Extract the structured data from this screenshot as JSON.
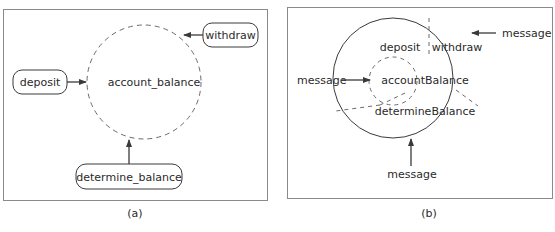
{
  "panel_a": {
    "caption": "(a)",
    "center_label": "account_balance",
    "operations": {
      "deposit": "deposit",
      "withdraw": "withdraw",
      "determine_balance": "determine_balance"
    }
  },
  "panel_b": {
    "caption": "(b)",
    "center_label": "accountBalance",
    "methods": {
      "deposit": "deposit",
      "withdraw": "withdraw",
      "determine_balance": "determineBalance"
    },
    "messages": {
      "left": "message",
      "top_right": "message",
      "bottom": "message"
    }
  },
  "colors": {
    "line": "#3a3a3a",
    "dashed": "#6a6a6a",
    "frame": "#8a8a8a"
  }
}
